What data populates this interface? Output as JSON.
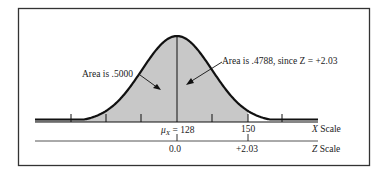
{
  "figure": {
    "type": "normal-distribution-diagram",
    "left_annotation": "Area is .5000",
    "right_annotation": "Area is .4788, since Z = +2.03",
    "x_axis": {
      "label": "X Scale",
      "label_var": "X",
      "label_word": "Scale",
      "mean_label_symbol": "μ",
      "mean_label_sub": "X",
      "mean_label_rest": " = 128",
      "mean_value": "128",
      "value_label": "150"
    },
    "z_axis": {
      "label": "Z Scale",
      "label_var": "Z",
      "label_word": "Scale",
      "zero_label": "0.0",
      "value_label": "+2.03"
    },
    "colors": {
      "shade": "#c8c8c8",
      "curve": "#111111",
      "frame": "#333333"
    }
  },
  "chart_data": {
    "type": "area",
    "title": "",
    "mean": 128,
    "x_marked": 150,
    "z_marked": 2.03,
    "area_left_of_mean": 0.5,
    "area_mean_to_x": 0.4788,
    "annotations": [
      "Area is .5000",
      "Area is .4788, since Z = +2.03"
    ],
    "xlabel": "X Scale",
    "secondary_xlabel": "Z Scale",
    "x_tick_labels": [
      "μX = 128",
      "150"
    ],
    "z_tick_labels": [
      "0.0",
      "+2.03"
    ]
  }
}
